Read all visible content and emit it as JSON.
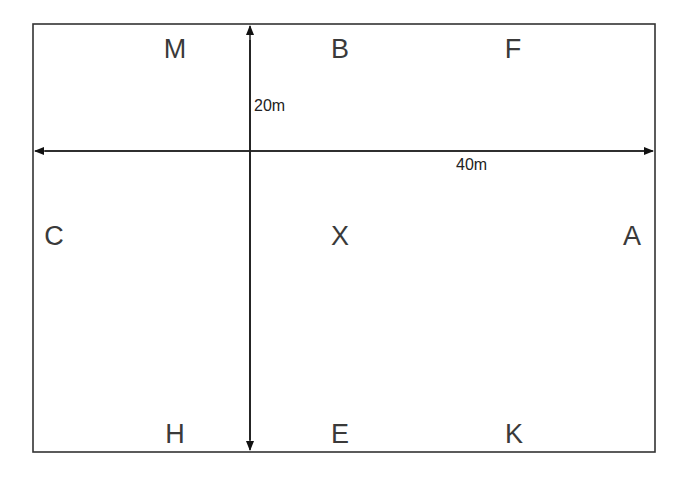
{
  "diagram": {
    "type": "dressage-arena",
    "border_color": "#333333",
    "markers": [
      {
        "label": "M",
        "x": 175,
        "y": 49
      },
      {
        "label": "B",
        "x": 340,
        "y": 49
      },
      {
        "label": "F",
        "x": 513,
        "y": 49
      },
      {
        "label": "C",
        "x": 54,
        "y": 236
      },
      {
        "label": "X",
        "x": 340,
        "y": 236
      },
      {
        "label": "A",
        "x": 632,
        "y": 236
      },
      {
        "label": "H",
        "x": 175,
        "y": 434
      },
      {
        "label": "E",
        "x": 340,
        "y": 434
      },
      {
        "label": "K",
        "x": 514,
        "y": 434
      }
    ],
    "dimensions": {
      "width_label": "20m",
      "length_label": "40m"
    }
  }
}
